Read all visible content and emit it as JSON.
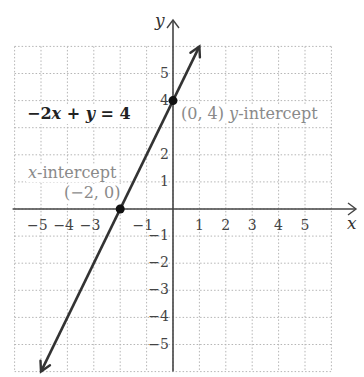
{
  "chart_data": {
    "type": "line",
    "title": "",
    "xlabel": "x",
    "ylabel": "y",
    "xlim": [
      -6,
      6
    ],
    "ylim": [
      -6,
      6
    ],
    "grid": true,
    "grid_style": "dotted",
    "x_tick_labels": [
      "-5",
      "-4",
      "-3",
      "-1",
      "1",
      "2",
      "3",
      "4",
      "5"
    ],
    "y_tick_labels": [
      "5",
      "4",
      "2",
      "1",
      "-1",
      "-2",
      "-3",
      "-4",
      "-5"
    ],
    "series": [
      {
        "name": "-2x + y = 4",
        "equation": "y = 2x + 4",
        "slope": 2,
        "intercept": 4,
        "x": [
          -5,
          1
        ],
        "y": [
          -6,
          6
        ],
        "arrows": "both"
      }
    ],
    "points": [
      {
        "x": 0,
        "y": 4,
        "label": "(0, 4) y-intercept"
      },
      {
        "x": -2,
        "y": 0,
        "label": "x-intercept (−2, 0)"
      }
    ],
    "annotations": [
      "−2x + y = 4",
      "(0, 4) y-intercept",
      "x-intercept",
      "(−2, 0)"
    ]
  },
  "labels": {
    "equation": {
      "a": "−2",
      "b": "x",
      "c": " + ",
      "d": "y",
      "e": " = 4"
    },
    "y_intercept": {
      "coord": "(0, 4) ",
      "var": "y",
      "text": "-intercept"
    },
    "x_intercept": {
      "var": "x",
      "text": "-intercept",
      "coord": "(−2, 0)"
    },
    "axis_x": "x",
    "axis_y": "y"
  },
  "colors": {
    "line": "#333333",
    "axis": "#444444",
    "grid": "#b0b0b0",
    "annotation": "#8a8a8a"
  }
}
